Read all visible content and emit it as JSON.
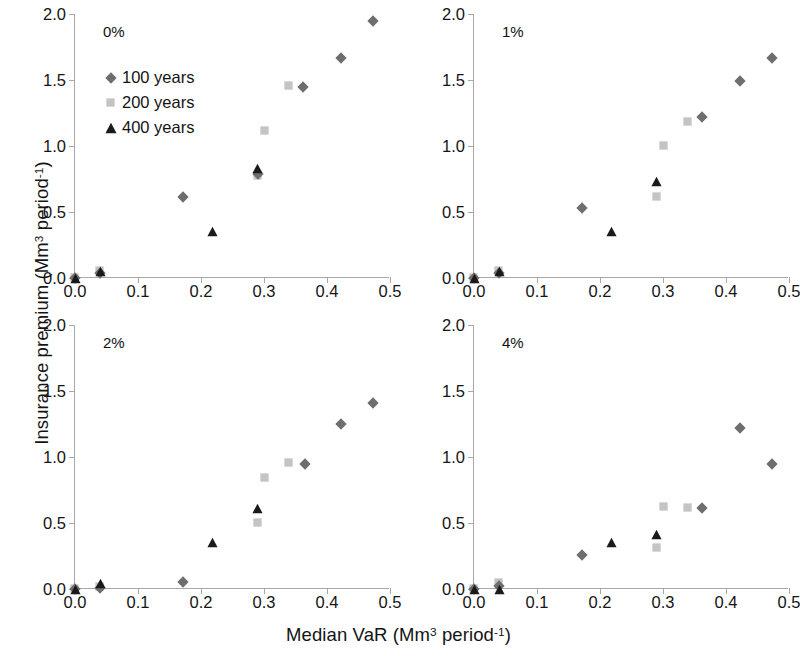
{
  "figure": {
    "xlabel_html": "Median VaR (Mm<sup>3</sup> period<sup>-1</sup>)",
    "ylabel_html": "Insurance premium (Mm<sup>3</sup> period<sup>-1</sup>)",
    "xlabel_plain": "Median VaR (Mm3 period-1)",
    "ylabel_plain": "Insurance premium (Mm3 period-1)"
  },
  "legend": {
    "position": "inside-top-left-panel",
    "entries": [
      {
        "label": "100 years",
        "marker": "diamond",
        "color": "#6e6e6e"
      },
      {
        "label": "200 years",
        "marker": "square",
        "color": "#c4c4c4"
      },
      {
        "label": "400 years",
        "marker": "triangle",
        "color": "#1a1a1a"
      }
    ]
  },
  "colors": {
    "series_100": "#6e6e6e",
    "series_200": "#c4c4c4",
    "series_400": "#1a1a1a",
    "axis": "#a8a8a8",
    "text": "#141414",
    "background": "#ffffff"
  },
  "axes": {
    "xticks": [
      "0.0",
      "0.1",
      "0.2",
      "0.3",
      "0.4",
      "0.5"
    ],
    "xtick_values": [
      0.0,
      0.1,
      0.2,
      0.3,
      0.4,
      0.5
    ],
    "yticks": [
      "0.0",
      "0.5",
      "1.0",
      "1.5",
      "2.0"
    ],
    "ytick_values": [
      0.0,
      0.5,
      1.0,
      1.5,
      2.0
    ],
    "xlim": [
      0.0,
      0.5
    ],
    "ylim": [
      0.0,
      2.0
    ],
    "grid": false
  },
  "chart_data": [
    {
      "type": "scatter",
      "title": "0%",
      "panel": "top-left",
      "xlabel": "Median VaR (Mm3 period-1)",
      "ylabel": "Insurance premium (Mm3 period-1)",
      "xlim": [
        0.0,
        0.5
      ],
      "ylim": [
        0.0,
        2.0
      ],
      "grid": false,
      "series": [
        {
          "name": "100 years",
          "marker": "diamond",
          "color": "#6e6e6e",
          "points": [
            [
              0.0,
              0.0
            ],
            [
              0.04,
              0.04
            ],
            [
              0.172,
              0.61
            ],
            [
              0.29,
              0.79
            ],
            [
              0.362,
              1.45
            ],
            [
              0.423,
              1.67
            ],
            [
              0.473,
              1.95
            ]
          ]
        },
        {
          "name": "200 years",
          "marker": "square",
          "color": "#c4c4c4",
          "points": [
            [
              0.0,
              0.0
            ],
            [
              0.04,
              0.05
            ],
            [
              0.292,
              0.77
            ],
            [
              0.303,
              1.11
            ],
            [
              0.34,
              1.45
            ]
          ]
        },
        {
          "name": "400 years",
          "marker": "triangle",
          "color": "#1a1a1a",
          "points": [
            [
              0.0,
              0.0
            ],
            [
              0.04,
              0.05
            ],
            [
              0.219,
              0.35
            ],
            [
              0.29,
              0.83
            ]
          ]
        }
      ]
    },
    {
      "type": "scatter",
      "title": "1%",
      "panel": "top-right",
      "xlabel": "Median VaR (Mm3 period-1)",
      "ylabel": "Insurance premium (Mm3 period-1)",
      "xlim": [
        0.0,
        0.5
      ],
      "ylim": [
        0.0,
        2.0
      ],
      "grid": false,
      "series": [
        {
          "name": "100 years",
          "marker": "diamond",
          "color": "#6e6e6e",
          "points": [
            [
              0.0,
              0.0
            ],
            [
              0.04,
              0.04
            ],
            [
              0.172,
              0.53
            ],
            [
              0.362,
              1.22
            ],
            [
              0.423,
              1.49
            ],
            [
              0.473,
              1.67
            ]
          ]
        },
        {
          "name": "200 years",
          "marker": "square",
          "color": "#c4c4c4",
          "points": [
            [
              0.0,
              0.0
            ],
            [
              0.04,
              0.05
            ],
            [
              0.292,
              0.61
            ],
            [
              0.303,
              1.0
            ],
            [
              0.34,
              1.18
            ]
          ]
        },
        {
          "name": "400 years",
          "marker": "triangle",
          "color": "#1a1a1a",
          "points": [
            [
              0.0,
              0.0
            ],
            [
              0.04,
              0.05
            ],
            [
              0.219,
              0.35
            ],
            [
              0.29,
              0.73
            ]
          ]
        }
      ]
    },
    {
      "type": "scatter",
      "title": "2%",
      "panel": "bottom-left",
      "xlabel": "Median VaR (Mm3 period-1)",
      "ylabel": "Insurance premium (Mm3 period-1)",
      "xlim": [
        0.0,
        0.5
      ],
      "ylim": [
        0.0,
        2.0
      ],
      "grid": false,
      "series": [
        {
          "name": "100 years",
          "marker": "diamond",
          "color": "#6e6e6e",
          "points": [
            [
              0.0,
              0.0
            ],
            [
              0.04,
              0.01
            ],
            [
              0.172,
              0.05
            ],
            [
              0.365,
              0.95
            ],
            [
              0.423,
              1.25
            ],
            [
              0.473,
              1.41
            ]
          ]
        },
        {
          "name": "200 years",
          "marker": "square",
          "color": "#c4c4c4",
          "points": [
            [
              0.0,
              0.0
            ],
            [
              0.04,
              0.01
            ],
            [
              0.292,
              0.5
            ],
            [
              0.303,
              0.84
            ],
            [
              0.34,
              0.95
            ]
          ]
        },
        {
          "name": "400 years",
          "marker": "triangle",
          "color": "#1a1a1a",
          "points": [
            [
              0.0,
              0.0
            ],
            [
              0.04,
              0.04
            ],
            [
              0.219,
              0.35
            ],
            [
              0.29,
              0.61
            ]
          ]
        }
      ]
    },
    {
      "type": "scatter",
      "title": "4%",
      "panel": "bottom-right",
      "xlabel": "Median VaR (Mm3 period-1)",
      "ylabel": "Insurance premium (Mm3 period-1)",
      "xlim": [
        0.0,
        0.5
      ],
      "ylim": [
        0.0,
        2.0
      ],
      "grid": false,
      "series": [
        {
          "name": "100 years",
          "marker": "diamond",
          "color": "#6e6e6e",
          "points": [
            [
              0.0,
              0.0
            ],
            [
              0.04,
              0.02
            ],
            [
              0.172,
              0.26
            ],
            [
              0.362,
              0.61
            ],
            [
              0.423,
              1.22
            ],
            [
              0.473,
              0.95
            ]
          ]
        },
        {
          "name": "200 years",
          "marker": "square",
          "color": "#c4c4c4",
          "points": [
            [
              0.0,
              0.0
            ],
            [
              0.04,
              0.04
            ],
            [
              0.292,
              0.31
            ],
            [
              0.303,
              0.62
            ],
            [
              0.34,
              0.61
            ]
          ]
        },
        {
          "name": "400 years",
          "marker": "triangle",
          "color": "#1a1a1a",
          "points": [
            [
              0.0,
              0.0
            ],
            [
              0.04,
              0.0
            ],
            [
              0.219,
              0.35
            ],
            [
              0.29,
              0.41
            ]
          ]
        }
      ]
    }
  ]
}
